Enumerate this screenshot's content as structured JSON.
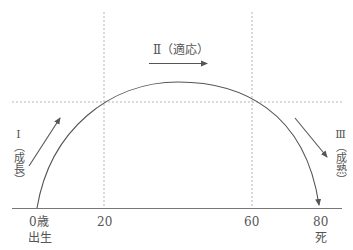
{
  "diagram": {
    "type": "life-stage arc",
    "stages": [
      {
        "numeral": "Ⅰ",
        "label": "（成長）",
        "vertical": "Ⅰ（成長）"
      },
      {
        "numeral": "Ⅱ",
        "label": "（適応）",
        "full": "Ⅱ（適応）"
      },
      {
        "numeral": "Ⅲ",
        "label": "（成熟）",
        "vertical": "Ⅲ（成熟）"
      }
    ],
    "axis": {
      "ticks": [
        {
          "value": "0歳",
          "sub": "出生"
        },
        {
          "value": "20"
        },
        {
          "value": "60"
        },
        {
          "value": "80",
          "sub": "死"
        }
      ]
    },
    "colors": {
      "line": "#555555",
      "grid": "#b0b0b0",
      "text": "#555555"
    }
  }
}
